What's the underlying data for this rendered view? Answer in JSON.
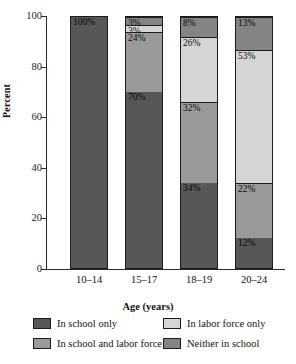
{
  "chart_data": {
    "type": "bar",
    "subtype": "stacked-100-percent",
    "title": "",
    "xlabel": "Age (years)",
    "ylabel": "Percent",
    "categories": [
      "10–14",
      "15–17",
      "18–19",
      "20–24"
    ],
    "ylim": [
      0,
      100
    ],
    "yticks": [
      0,
      20,
      40,
      60,
      80,
      100
    ],
    "ytick_labels": [
      "0",
      "20",
      "40",
      "60",
      "80",
      "100"
    ],
    "grid": false,
    "legend_position": "bottom",
    "stack_order": "bottom-to-top",
    "series": [
      {
        "name": "In school only",
        "color": "#575757",
        "values": [
          100,
          70,
          34,
          12
        ],
        "labels": [
          "100%",
          "70%",
          "34%",
          "12%"
        ]
      },
      {
        "name": "In school and labor force",
        "color": "#9a9a9a",
        "values": [
          0,
          24,
          32,
          22
        ],
        "labels": [
          "",
          "24%",
          "32%",
          "22%"
        ]
      },
      {
        "name": "In labor force only",
        "color": "#d5d5d5",
        "values": [
          0,
          3,
          26,
          53
        ],
        "labels": [
          "",
          "3%",
          "26%",
          "53%"
        ]
      },
      {
        "name": "Neither in school",
        "color": "#848484",
        "values": [
          0,
          3,
          8,
          13
        ],
        "labels": [
          "",
          "3%",
          "8%",
          "13%"
        ]
      }
    ]
  },
  "axes": {
    "y_title": "Percent",
    "x_title": "Age (years)"
  },
  "legend": {
    "items": [
      {
        "label": "In school only",
        "color": "#575757"
      },
      {
        "label": "In school and labor force",
        "color": "#9a9a9a"
      },
      {
        "label": "In labor force only",
        "color": "#d5d5d5"
      },
      {
        "label": "Neither in school",
        "color": "#848484"
      }
    ]
  }
}
